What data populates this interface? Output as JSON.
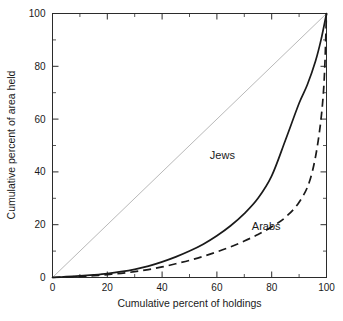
{
  "chart_data": {
    "type": "line",
    "title": "",
    "xlabel": "Cumulative percent of holdings",
    "ylabel": "Cumulative percent of area held",
    "xlim": [
      0,
      100
    ],
    "ylim": [
      0,
      100
    ],
    "xticks": [
      0,
      20,
      40,
      60,
      80,
      100
    ],
    "yticks": [
      0,
      20,
      40,
      60,
      80,
      100
    ],
    "xtick_labels": [
      "0",
      "20",
      "40",
      "60",
      "80",
      "100"
    ],
    "ytick_labels": [
      "0",
      "20",
      "40",
      "60",
      "80",
      "100"
    ],
    "minor_tick_interval": 10,
    "grid": false,
    "legend_position": "inline-annotations",
    "series": [
      {
        "name": "equality-line",
        "label": "",
        "style": "solid-thin-gray",
        "color": "#b9b9b9",
        "x": [
          0,
          100
        ],
        "values": [
          0,
          100
        ]
      },
      {
        "name": "Jews",
        "label": "Jews",
        "style": "solid",
        "color": "#1a1a1a",
        "x": [
          0,
          5,
          10,
          15,
          20,
          25,
          30,
          35,
          40,
          45,
          50,
          55,
          60,
          65,
          70,
          75,
          80,
          85,
          90,
          93,
          96,
          98,
          100
        ],
        "values": [
          0,
          0.3,
          0.6,
          1.0,
          1.5,
          2.2,
          3.1,
          4.3,
          5.9,
          7.8,
          10.0,
          12.6,
          15.8,
          19.6,
          24.2,
          30.0,
          38.5,
          52.0,
          66.0,
          73.0,
          82.0,
          90.0,
          100
        ]
      },
      {
        "name": "Arabs",
        "label": "Arabs",
        "style": "dashed",
        "color": "#1a1a1a",
        "x": [
          0,
          5,
          10,
          15,
          20,
          25,
          30,
          35,
          40,
          45,
          50,
          55,
          60,
          65,
          70,
          75,
          80,
          85,
          90,
          94,
          97,
          99,
          100
        ],
        "values": [
          0,
          0.2,
          0.4,
          0.7,
          1.1,
          1.6,
          2.2,
          3.0,
          4.0,
          5.2,
          6.5,
          8.0,
          9.7,
          11.6,
          13.8,
          16.3,
          19.2,
          22.8,
          28.5,
          37.0,
          52.0,
          72.0,
          100
        ]
      }
    ],
    "annotations": [
      {
        "text": "Jews",
        "x": 62,
        "y": 45
      },
      {
        "text": "Arabs",
        "x": 78,
        "y": 18
      }
    ]
  }
}
